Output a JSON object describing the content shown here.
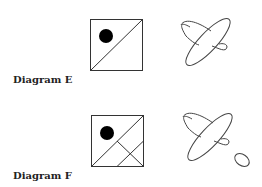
{
  "diagrams": [
    {
      "label": "Diagram E",
      "square": {
        "x": 90,
        "y": 19,
        "size": 52,
        "diagonal": "bottom-left to top-right",
        "dot": {
          "cx": 106,
          "cy": 36,
          "r": 6
        },
        "extra_lines": []
      },
      "ellipses": [
        {
          "cx": 208,
          "cy": 42,
          "rx": 27,
          "ry": 9,
          "rotate": -48
        },
        {
          "cx": 203,
          "cy": 36,
          "rx": 23,
          "ry": 11,
          "rotate": 40
        }
      ]
    },
    {
      "label": "Diagram F",
      "square": {
        "x": 91,
        "y": 115,
        "size": 52,
        "diagonal": "bottom-left to top-right",
        "dot": {
          "cx": 107,
          "cy": 133,
          "r": 6
        },
        "extra_lines": [
          "lattice in lower-right triangle"
        ]
      },
      "ellipses": [
        {
          "cx": 209,
          "cy": 134,
          "rx": 27,
          "ry": 9,
          "rotate": -48
        },
        {
          "cx": 204,
          "cy": 128,
          "rx": 23,
          "ry": 11,
          "rotate": 40
        },
        {
          "cx": 241,
          "cy": 160,
          "rx": 7,
          "ry": 5,
          "rotate": 30
        }
      ]
    }
  ],
  "colors": {
    "stroke": "#333333",
    "fill": "#000000",
    "background": "#ffffff"
  }
}
